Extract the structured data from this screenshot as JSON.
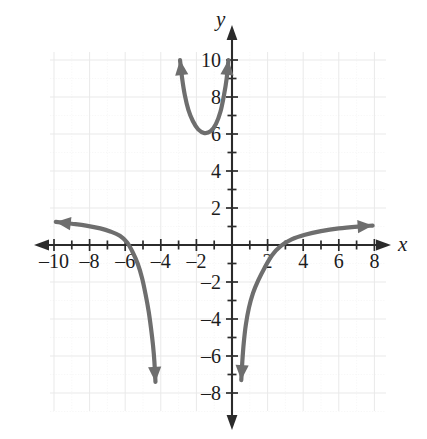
{
  "figure": {
    "kind": "coordinate-plane-graph",
    "background_color": "#ffffff",
    "curve_color": "#6e6e6e",
    "axis_color": "#2b2b2b",
    "grid_color": "#e9e9e9"
  },
  "axes": {
    "x_axis_label": "x",
    "y_axis_label": "y",
    "x_tick_labels": [
      "–10",
      "–8",
      "–6",
      "–4",
      "–2",
      "2",
      "4",
      "6",
      "8"
    ],
    "x_tick_values": [
      -10,
      -8,
      -6,
      -4,
      -2,
      2,
      4,
      6,
      8
    ],
    "y_tick_labels": [
      "10",
      "8",
      "6",
      "4",
      "2",
      "–2",
      "–4",
      "–6",
      "–8"
    ],
    "y_tick_values": [
      10,
      8,
      6,
      4,
      2,
      -2,
      -4,
      -6,
      -8
    ],
    "x_range": [
      -11,
      8.6
    ],
    "y_range": [
      -8.7,
      10.6
    ],
    "minor_tick_step": 1,
    "label_step": 2,
    "grid": "on"
  },
  "chart_data": {
    "type": "line",
    "title": "",
    "xlabel": "x",
    "ylabel": "y",
    "xlim": [
      -11,
      8.6
    ],
    "ylim": [
      -8.7,
      10.6
    ],
    "grid": true,
    "legend": "none",
    "series": [
      {
        "name": "upper-branch",
        "description": "U-shaped branch opening upward with vertical asymptotic arms",
        "arrow_start": "up",
        "arrow_end": "up",
        "points": [
          [
            -2.92,
            10.0
          ],
          [
            -2.8,
            9.0
          ],
          [
            -2.65,
            8.1
          ],
          [
            -2.45,
            7.3
          ],
          [
            -2.2,
            6.7
          ],
          [
            -1.9,
            6.25
          ],
          [
            -1.55,
            6.05
          ],
          [
            -1.2,
            6.15
          ],
          [
            -0.9,
            6.55
          ],
          [
            -0.65,
            7.2
          ],
          [
            -0.45,
            8.1
          ],
          [
            -0.3,
            9.0
          ],
          [
            -0.2,
            10.0
          ]
        ]
      },
      {
        "name": "left-branch",
        "description": "Decreasing branch from a left horizontal arrow, crossing x-axis near -5.8 and falling to a downward arrow near -4.2",
        "arrow_start": "left",
        "arrow_end": "down",
        "points": [
          [
            -9.9,
            1.25
          ],
          [
            -9.0,
            1.15
          ],
          [
            -8.2,
            1.05
          ],
          [
            -7.4,
            0.9
          ],
          [
            -6.8,
            0.72
          ],
          [
            -6.3,
            0.5
          ],
          [
            -5.9,
            0.15
          ],
          [
            -5.6,
            -0.35
          ],
          [
            -5.3,
            -1.0
          ],
          [
            -5.05,
            -1.8
          ],
          [
            -4.85,
            -2.7
          ],
          [
            -4.68,
            -3.6
          ],
          [
            -4.55,
            -4.5
          ],
          [
            -4.44,
            -5.4
          ],
          [
            -4.36,
            -6.3
          ],
          [
            -4.3,
            -7.4
          ]
        ]
      },
      {
        "name": "right-branch",
        "description": "Increasing branch rising from a downward arrow near 0.5, crossing x-axis near 2.2 and flattening to a right horizontal arrow",
        "arrow_start": "down",
        "arrow_end": "right",
        "points": [
          [
            0.52,
            -7.3
          ],
          [
            0.58,
            -6.3
          ],
          [
            0.66,
            -5.3
          ],
          [
            0.78,
            -4.3
          ],
          [
            0.95,
            -3.4
          ],
          [
            1.18,
            -2.6
          ],
          [
            1.48,
            -1.9
          ],
          [
            1.85,
            -1.2
          ],
          [
            2.25,
            -0.55
          ],
          [
            2.75,
            -0.05
          ],
          [
            3.35,
            0.3
          ],
          [
            4.1,
            0.55
          ],
          [
            5.0,
            0.75
          ],
          [
            6.0,
            0.9
          ],
          [
            7.1,
            1.0
          ],
          [
            7.9,
            1.05
          ]
        ]
      }
    ]
  }
}
